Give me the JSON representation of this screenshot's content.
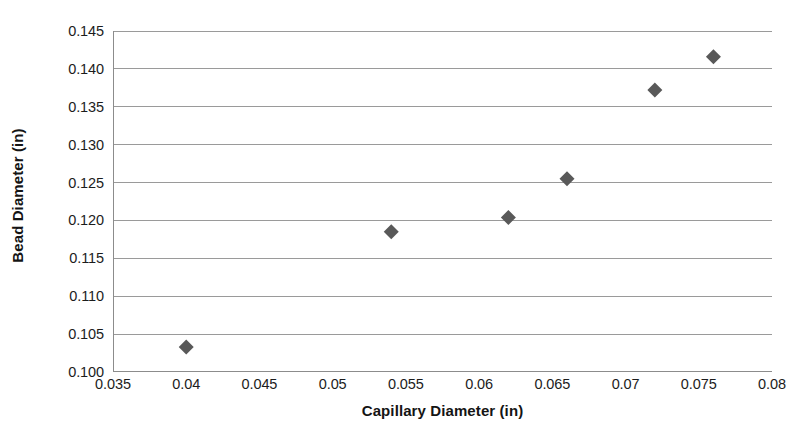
{
  "chart_data": {
    "type": "scatter",
    "title": "",
    "xlabel": "Capillary Diameter (in)",
    "ylabel": "Bead Diameter (in)",
    "xlim": [
      0.035,
      0.08
    ],
    "ylim": [
      0.1,
      0.145
    ],
    "xticks": [
      "0.035",
      "0.04",
      "0.045",
      "0.05",
      "0.055",
      "0.06",
      "0.065",
      "0.07",
      "0.075",
      "0.08"
    ],
    "xtick_values": [
      0.035,
      0.04,
      0.045,
      0.05,
      0.055,
      0.06,
      0.065,
      0.07,
      0.075,
      0.08
    ],
    "yticks": [
      "0.100",
      "0.105",
      "0.110",
      "0.115",
      "0.120",
      "0.125",
      "0.130",
      "0.135",
      "0.140",
      "0.145"
    ],
    "ytick_values": [
      0.1,
      0.105,
      0.11,
      0.115,
      0.12,
      0.125,
      0.13,
      0.135,
      0.14,
      0.145
    ],
    "grid": "horizontal",
    "legend": "none",
    "marker": "diamond",
    "marker_color": "#595959",
    "series": [
      {
        "name": "Bead Diameter",
        "x": [
          0.04,
          0.054,
          0.062,
          0.066,
          0.072,
          0.076
        ],
        "y": [
          0.1033,
          0.1185,
          0.1204,
          0.1255,
          0.1372,
          0.1416
        ],
        "points": [
          {
            "x": 0.04,
            "y": 0.1033
          },
          {
            "x": 0.054,
            "y": 0.1185
          },
          {
            "x": 0.062,
            "y": 0.1204
          },
          {
            "x": 0.066,
            "y": 0.1255
          },
          {
            "x": 0.072,
            "y": 0.1372
          },
          {
            "x": 0.076,
            "y": 0.1416
          }
        ]
      }
    ],
    "colors": {
      "background": "#ffffff",
      "gridline": "#9a9a9a",
      "axis": "#8c8c8c",
      "text": "#1c1c1c",
      "marker": "#595959"
    }
  }
}
